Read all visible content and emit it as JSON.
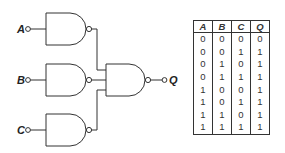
{
  "circuit": {
    "inputs": [
      {
        "label": "A"
      },
      {
        "label": "B"
      },
      {
        "label": "C"
      }
    ],
    "output": {
      "label": "Q"
    },
    "gates": [
      {
        "type": "NAND",
        "inputs": [
          "A"
        ],
        "role": "input-gate-a"
      },
      {
        "type": "NAND",
        "inputs": [
          "B"
        ],
        "role": "input-gate-b"
      },
      {
        "type": "NAND",
        "inputs": [
          "C"
        ],
        "role": "input-gate-c"
      },
      {
        "type": "NAND",
        "inputs": [
          "gate-a",
          "gate-b",
          "gate-c"
        ],
        "role": "output-gate"
      }
    ],
    "line_color": "#333333"
  },
  "truth_table": {
    "headers": [
      "A",
      "B",
      "C",
      "Q"
    ],
    "rows": [
      [
        "0",
        "0",
        "0",
        "0"
      ],
      [
        "0",
        "0",
        "1",
        "1"
      ],
      [
        "0",
        "1",
        "0",
        "1"
      ],
      [
        "0",
        "1",
        "1",
        "1"
      ],
      [
        "1",
        "0",
        "0",
        "1"
      ],
      [
        "1",
        "0",
        "1",
        "1"
      ],
      [
        "1",
        "1",
        "0",
        "1"
      ],
      [
        "1",
        "1",
        "1",
        "1"
      ]
    ]
  }
}
